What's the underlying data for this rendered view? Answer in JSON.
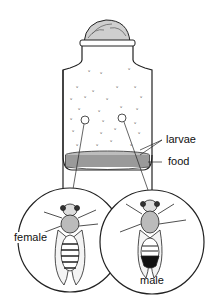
{
  "diagram": {
    "labels": {
      "larvae": "larvae",
      "food": "food",
      "female": "female",
      "male": "male"
    },
    "colors": {
      "line": "#1a1a1a",
      "food_fill": "#9a9a9a",
      "background": "#ffffff"
    }
  }
}
